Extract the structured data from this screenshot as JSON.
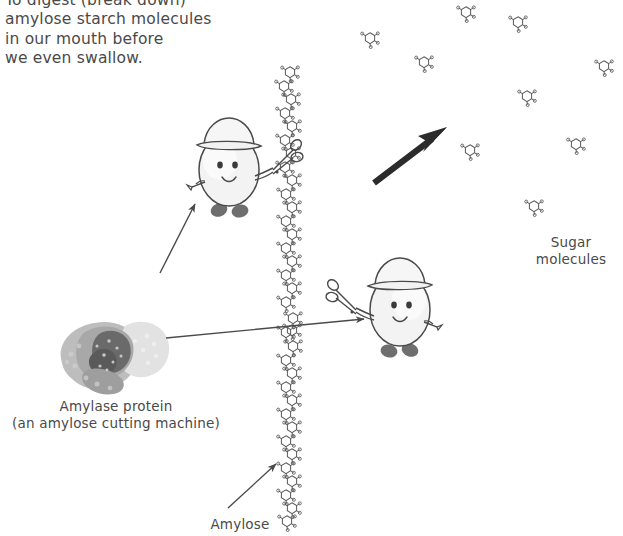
{
  "diagram": {
    "background_color": "#ffffff",
    "ink_color": "#4a4a4a",
    "arrow_color": "#2b2b2b",
    "width": 623,
    "height": 536
  },
  "intro_text": "To digest (break down)\namylose starch molecules\nin our mouth before\nwe even swallow.",
  "labels": {
    "amylase": "Amylase protein\n(an amylose cutting machine)",
    "sugar": "Sugar\nmolecules",
    "amylose": "Amylose"
  },
  "elements": {
    "amylase_protein": {
      "name": "Amylase protein",
      "description": "grayscale space-filling protein blob",
      "x": 55,
      "y": 308,
      "width": 118,
      "height": 92
    },
    "amylose_chain": {
      "name": "Amylose polymer chain",
      "description": "vertical zigzag chain of linked sugar rings",
      "x": 288,
      "y_top": 66,
      "y_bottom": 522,
      "ring_count": 34
    },
    "characters": [
      {
        "name": "amylase-character-upper",
        "description": "cartoon egg character wearing a hat holding scissors",
        "x": 189,
        "y": 118,
        "width": 100,
        "height": 100,
        "facing": "right",
        "holds": "scissors"
      },
      {
        "name": "amylase-character-lower",
        "description": "cartoon egg character wearing a hat holding scissors",
        "x": 340,
        "y": 258,
        "width": 100,
        "height": 100,
        "facing": "left",
        "holds": "scissors"
      }
    ],
    "sugar_molecules": [
      {
        "x": 466,
        "y": 12
      },
      {
        "x": 518,
        "y": 22
      },
      {
        "x": 370,
        "y": 38
      },
      {
        "x": 424,
        "y": 62
      },
      {
        "x": 604,
        "y": 66
      },
      {
        "x": 527,
        "y": 96
      },
      {
        "x": 470,
        "y": 150
      },
      {
        "x": 576,
        "y": 144
      },
      {
        "x": 534,
        "y": 206
      },
      {
        "x": 292,
        "y": 330
      }
    ],
    "arrows": [
      {
        "name": "product-arrow",
        "style": "thick-black",
        "from": [
          375,
          182
        ],
        "to": [
          444,
          130
        ],
        "meaning": "amylose is converted into sugar molecules"
      },
      {
        "name": "pointer-to-upper-character",
        "style": "thin",
        "from": [
          160,
          272
        ],
        "to": [
          196,
          203
        ]
      },
      {
        "name": "pointer-protein-to-lower-character",
        "style": "thin",
        "from": [
          166,
          337
        ],
        "to": [
          366,
          318
        ]
      },
      {
        "name": "pointer-to-amylose-chain",
        "style": "thin",
        "from": [
          228,
          507
        ],
        "to": [
          277,
          463
        ]
      }
    ]
  }
}
